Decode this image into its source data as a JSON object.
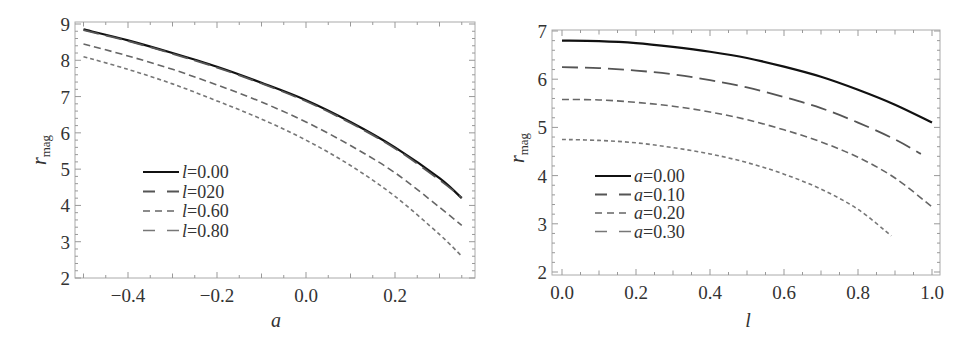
{
  "chart_data": [
    {
      "type": "line",
      "title": "",
      "xlabel": "a",
      "ylabel": "r_mag",
      "ylabel_main": "r",
      "ylabel_sub": "mag",
      "xlim": [
        -0.52,
        0.38
      ],
      "ylim": [
        1.95,
        9.05
      ],
      "xticks": [
        -0.4,
        -0.2,
        0.0,
        0.2
      ],
      "xtick_labels": [
        "−0.4",
        "−0.2",
        "0.0",
        "0.2"
      ],
      "yticks": [
        2,
        3,
        4,
        5,
        6,
        7,
        8,
        9
      ],
      "ytick_labels": [
        "2",
        "3",
        "4",
        "5",
        "6",
        "7",
        "8",
        "9"
      ],
      "grid": false,
      "legend_position": "lower-left (inside)",
      "x": [
        -0.5,
        -0.4,
        -0.3,
        -0.2,
        -0.1,
        0.0,
        0.1,
        0.2,
        0.3,
        0.35
      ],
      "series": [
        {
          "name": "l=0.00",
          "legend_var": "l",
          "legend_value": "=0.00",
          "style": "solid",
          "color": "#111111",
          "values": [
            8.85,
            8.55,
            8.2,
            7.82,
            7.38,
            6.9,
            6.3,
            5.6,
            4.75,
            4.2
          ]
        },
        {
          "name": "l=020",
          "legend_var": "l",
          "legend_value": "=020",
          "style": "longdash",
          "color": "#555555",
          "values": [
            8.83,
            8.53,
            8.18,
            7.8,
            7.36,
            6.87,
            6.27,
            5.57,
            4.7,
            4.22
          ]
        },
        {
          "name": "l=0.60",
          "legend_var": "l",
          "legend_value": "=0.60",
          "style": "dash",
          "color": "#666666",
          "values": [
            8.45,
            8.12,
            7.75,
            7.32,
            6.85,
            6.3,
            5.65,
            4.9,
            3.95,
            3.45
          ]
        },
        {
          "name": "l=0.80",
          "legend_var": "l",
          "legend_value": "=0.80",
          "style": "shortdash",
          "color": "#777777",
          "values": [
            8.1,
            7.75,
            7.35,
            6.88,
            6.38,
            5.8,
            5.1,
            4.25,
            3.2,
            2.6
          ]
        }
      ]
    },
    {
      "type": "line",
      "title": "",
      "xlabel": "l",
      "ylabel": "r_mag",
      "ylabel_main": "r",
      "ylabel_sub": "mag",
      "xlim": [
        -0.02,
        1.02
      ],
      "ylim": [
        1.95,
        7.05
      ],
      "xticks": [
        0.0,
        0.2,
        0.4,
        0.6,
        0.8,
        1.0
      ],
      "xtick_labels": [
        "0.0",
        "0.2",
        "0.4",
        "0.6",
        "0.8",
        "1.0"
      ],
      "yticks": [
        2,
        3,
        4,
        5,
        6,
        7
      ],
      "ytick_labels": [
        "2",
        "3",
        "4",
        "5",
        "6",
        "7"
      ],
      "grid": false,
      "legend_position": "lower-left (inside)",
      "series": [
        {
          "name": "a=0.00",
          "legend_var": "a",
          "legend_value": "=0.00",
          "style": "solid",
          "color": "#111111",
          "x": [
            0.0,
            0.1,
            0.2,
            0.3,
            0.4,
            0.5,
            0.6,
            0.7,
            0.8,
            0.9,
            1.0
          ],
          "values": [
            6.8,
            6.79,
            6.75,
            6.67,
            6.57,
            6.44,
            6.26,
            6.05,
            5.78,
            5.47,
            5.1
          ]
        },
        {
          "name": "a=0.10",
          "legend_var": "a",
          "legend_value": "=0.10",
          "style": "longdash",
          "color": "#555555",
          "x": [
            0.0,
            0.1,
            0.2,
            0.3,
            0.4,
            0.5,
            0.6,
            0.7,
            0.8,
            0.9,
            0.97
          ],
          "values": [
            6.25,
            6.23,
            6.18,
            6.1,
            5.98,
            5.83,
            5.63,
            5.4,
            5.1,
            4.75,
            4.45
          ]
        },
        {
          "name": "a=0.20",
          "legend_var": "a",
          "legend_value": "=0.20",
          "style": "dash",
          "color": "#666666",
          "x": [
            0.0,
            0.1,
            0.2,
            0.3,
            0.4,
            0.5,
            0.6,
            0.7,
            0.8,
            0.9,
            1.0
          ],
          "values": [
            5.58,
            5.57,
            5.52,
            5.44,
            5.32,
            5.16,
            4.95,
            4.7,
            4.38,
            3.95,
            3.35
          ]
        },
        {
          "name": "a=0.30",
          "legend_var": "a",
          "legend_value": "=0.30",
          "style": "shortdash",
          "color": "#777777",
          "x": [
            0.0,
            0.1,
            0.2,
            0.3,
            0.4,
            0.5,
            0.6,
            0.7,
            0.8,
            0.89
          ],
          "values": [
            4.75,
            4.73,
            4.68,
            4.58,
            4.45,
            4.27,
            4.03,
            3.72,
            3.3,
            2.75
          ]
        }
      ]
    }
  ]
}
